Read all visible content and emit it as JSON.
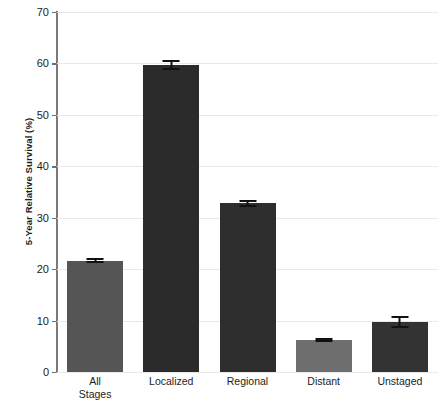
{
  "chart_data": {
    "type": "bar",
    "title": "",
    "xlabel": "",
    "ylabel": "5-Year Relative Survival (%)",
    "categories": [
      "All Stages",
      "Localized",
      "Regional",
      "Distant",
      "Unstaged"
    ],
    "category_lines": [
      [
        "All",
        "Stages"
      ],
      [
        "Localized"
      ],
      [
        "Regional"
      ],
      [
        "Distant"
      ],
      [
        "Unstaged"
      ]
    ],
    "values": [
      21.6,
      59.7,
      32.8,
      6.2,
      9.7
    ],
    "errors": [
      0.5,
      0.9,
      0.7,
      0.4,
      1.2
    ],
    "ylim": [
      0,
      70
    ],
    "yticks": [
      0,
      10,
      20,
      30,
      40,
      50,
      60,
      70
    ],
    "ytick_labels": [
      "0",
      "10",
      "20",
      "30",
      "40",
      "50",
      "60",
      "70"
    ],
    "grid": true,
    "legend": "none",
    "bar_colors": [
      "#555555",
      "#2b2b2b",
      "#2e2e2e",
      "#6e6e6e",
      "#333333"
    ],
    "error_color": "#111111",
    "grid_color": "#e9e9e9",
    "axis_color": "#7a7a7a"
  }
}
